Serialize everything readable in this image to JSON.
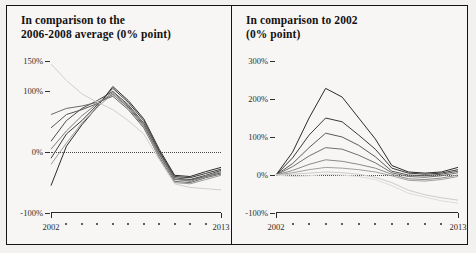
{
  "panels": [
    {
      "title_line1": "In comparison to the",
      "title_line2": "2006-2008 average (0% point)",
      "xlabel_start": "2002",
      "xlabel_end": "2013"
    },
    {
      "title_line1": "In comparison to 2002",
      "title_line2": "(0% point)",
      "xlabel_start": "2002",
      "xlabel_end": "2013"
    }
  ],
  "chart_data": [
    {
      "type": "line",
      "title": "In comparison to the 2006-2008 average (0% point)",
      "xlabel": "",
      "ylabel": "",
      "x": [
        2002,
        2003,
        2004,
        2005,
        2006,
        2007,
        2008,
        2009,
        2010,
        2011,
        2012,
        2013
      ],
      "xlim": [
        2002,
        2013
      ],
      "ylim": [
        -100,
        150
      ],
      "yticks": [
        -100,
        0,
        100,
        150
      ],
      "ytick_labels": [
        "-100%",
        "0%",
        "100%",
        "150%"
      ],
      "grid": false,
      "zero_reference_line": true,
      "legend": "none",
      "series": [
        {
          "name": "series-1",
          "color": "#2b2b2b",
          "values": [
            -55,
            10,
            45,
            75,
            108,
            85,
            55,
            5,
            -38,
            -40,
            -32,
            -25
          ]
        },
        {
          "name": "series-2",
          "color": "#3a3a3a",
          "values": [
            -10,
            30,
            52,
            78,
            105,
            82,
            52,
            2,
            -40,
            -42,
            -35,
            -28
          ]
        },
        {
          "name": "series-3",
          "color": "#4a4a4a",
          "values": [
            18,
            52,
            72,
            85,
            100,
            78,
            48,
            0,
            -42,
            -45,
            -38,
            -30
          ]
        },
        {
          "name": "series-4",
          "color": "#555555",
          "values": [
            40,
            62,
            70,
            80,
            95,
            74,
            44,
            -4,
            -45,
            -46,
            -40,
            -34
          ]
        },
        {
          "name": "series-5",
          "color": "#6a6a6a",
          "values": [
            62,
            72,
            76,
            82,
            92,
            70,
            40,
            -8,
            -48,
            -50,
            -42,
            -36
          ]
        },
        {
          "name": "series-6",
          "color": "#7d7d7d",
          "values": [
            5,
            35,
            60,
            80,
            98,
            76,
            46,
            -2,
            -44,
            -48,
            -40,
            -32
          ]
        },
        {
          "name": "series-7",
          "color": "#9a9a9a",
          "values": [
            -20,
            15,
            48,
            74,
            96,
            72,
            42,
            -10,
            -50,
            -52,
            -45,
            -38
          ]
        },
        {
          "name": "series-8-light",
          "color": "#cfcfcf",
          "values": [
            145,
            118,
            96,
            82,
            70,
            52,
            30,
            -12,
            -52,
            -58,
            -60,
            -62
          ]
        }
      ]
    },
    {
      "type": "line",
      "title": "In comparison to 2002 (0% point)",
      "xlabel": "",
      "ylabel": "",
      "x": [
        2002,
        2003,
        2004,
        2005,
        2006,
        2007,
        2008,
        2009,
        2010,
        2011,
        2012,
        2013
      ],
      "xlim": [
        2002,
        2013
      ],
      "ylim": [
        -100,
        300
      ],
      "yticks": [
        -100,
        0,
        100,
        200,
        300
      ],
      "ytick_labels": [
        "-100%",
        "0%",
        "100%",
        "200%",
        "300%"
      ],
      "grid": false,
      "zero_reference_line": true,
      "legend": "none",
      "series": [
        {
          "name": "series-1",
          "color": "#2b2b2b",
          "values": [
            0,
            60,
            150,
            228,
            205,
            150,
            95,
            25,
            8,
            5,
            8,
            20
          ]
        },
        {
          "name": "series-2",
          "color": "#3a3a3a",
          "values": [
            0,
            45,
            105,
            150,
            140,
            105,
            68,
            18,
            5,
            2,
            5,
            14
          ]
        },
        {
          "name": "series-3",
          "color": "#5a5a5a",
          "values": [
            0,
            30,
            72,
            110,
            100,
            78,
            48,
            10,
            0,
            -2,
            2,
            10
          ]
        },
        {
          "name": "series-4",
          "color": "#707070",
          "values": [
            0,
            22,
            50,
            72,
            68,
            52,
            32,
            6,
            -4,
            -6,
            -2,
            6
          ]
        },
        {
          "name": "series-5",
          "color": "#8a8a8a",
          "values": [
            0,
            12,
            28,
            40,
            36,
            28,
            18,
            2,
            -10,
            -12,
            -8,
            0
          ]
        },
        {
          "name": "series-6",
          "color": "#a0a0a0",
          "values": [
            0,
            6,
            14,
            20,
            18,
            14,
            8,
            -2,
            -14,
            -16,
            -12,
            -4
          ]
        },
        {
          "name": "series-7-light",
          "color": "#cccccc",
          "values": [
            0,
            2,
            5,
            8,
            6,
            2,
            -6,
            -20,
            -40,
            -52,
            -60,
            -66
          ]
        },
        {
          "name": "series-8-light",
          "color": "#dcdcdc",
          "values": [
            0,
            -4,
            -2,
            2,
            0,
            -4,
            -12,
            -28,
            -48,
            -58,
            -68,
            -74
          ]
        }
      ]
    }
  ]
}
